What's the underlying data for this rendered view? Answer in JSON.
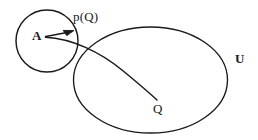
{
  "figure": {
    "type": "set-theory-diagram",
    "background_color": "#ffffff",
    "stroke_color": "#1a1a1a",
    "labels": {
      "small_set": "A",
      "projection_point": "p(Q)",
      "outer_point": "Q",
      "universe": "U"
    },
    "shapes": {
      "small_circle": {
        "name": "set-A-circle",
        "center_x": 47,
        "center_y": 41,
        "radius": 31
      },
      "large_ellipse": {
        "name": "universe-U-ellipse",
        "center_x": 150,
        "center_y": 80,
        "radius_x": 77,
        "radius_y": 53
      },
      "arrow": {
        "name": "projection-arrow",
        "from_x": 45,
        "from_y": 36,
        "to_x": 73,
        "to_y": 31
      },
      "curve": {
        "name": "geodesic-curve",
        "start_x": 45,
        "start_y": 37,
        "end_x": 157,
        "end_y": 100
      }
    }
  }
}
